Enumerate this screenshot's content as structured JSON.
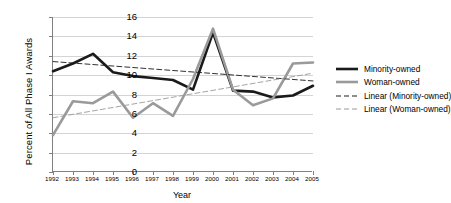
{
  "chart_data": {
    "type": "line",
    "title": "",
    "xlabel": "Year",
    "ylabel": "Percent of All Phase I Awards",
    "categories": [
      "1992",
      "1993",
      "1994",
      "1995",
      "1996",
      "1997",
      "1998",
      "1999",
      "2000",
      "2001",
      "2002",
      "2003",
      "2004",
      "2005"
    ],
    "x": [
      1992,
      1993,
      1994,
      1995,
      1996,
      1997,
      1998,
      1999,
      2000,
      2001,
      2002,
      2003,
      2004,
      2005
    ],
    "ylim": [
      0,
      16
    ],
    "ytick_step": 2,
    "yticks": [
      "0",
      "2",
      "4",
      "6",
      "8",
      "10",
      "12",
      "14",
      "16"
    ],
    "grid": "horizontal",
    "legend_position": "right",
    "series": [
      {
        "name": "Minority-owned",
        "type": "data",
        "color": "#1a1a1a",
        "style": "solid",
        "values": [
          10.4,
          11.2,
          12.2,
          10.3,
          9.9,
          9.7,
          9.5,
          8.5,
          14.4,
          8.4,
          8.3,
          7.7,
          7.9,
          8.9
        ]
      },
      {
        "name": "Woman-owned",
        "type": "data",
        "color": "#9a9a9a",
        "style": "solid",
        "values": [
          3.8,
          7.3,
          7.1,
          8.3,
          5.6,
          7.1,
          5.8,
          9.6,
          14.8,
          8.5,
          6.9,
          7.6,
          11.2,
          11.3
        ]
      },
      {
        "name": "Linear (Minority-owned)",
        "type": "trend",
        "color": "#1a1a1a",
        "style": "dashed",
        "endpoints": [
          11.4,
          9.4
        ]
      },
      {
        "name": "Linear (Woman-owned)",
        "type": "trend",
        "color": "#9a9a9a",
        "style": "dashed",
        "endpoints": [
          5.6,
          10.2
        ]
      }
    ]
  },
  "legend": {
    "items": [
      {
        "label": "Minority-owned"
      },
      {
        "label": "Woman-owned"
      },
      {
        "label": "Linear (Minority-owned)"
      },
      {
        "label": "Linear (Woman-owned)"
      }
    ]
  }
}
